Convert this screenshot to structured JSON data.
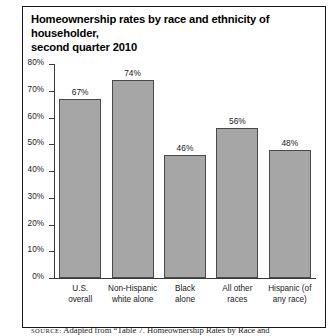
{
  "figure": {
    "title": "Homeownership rates by race and ethnicity of householder, second quarter 2010",
    "title_line1": "Homeownership rates by race and ethnicity of householder,",
    "title_line2": "second quarter 2010",
    "source_kicker": "SOURCE:",
    "source_text": "Adapted from “Table 7. Homeownership Rates by Race and"
  },
  "chart_data": {
    "type": "bar",
    "title": "Homeownership rates by race and ethnicity of householder, second quarter 2010",
    "xlabel": "",
    "ylabel": "",
    "categories": [
      "U.S. overall",
      "Non-Hispanic white alone",
      "Black alone",
      "All other races",
      "Hispanic (of any race)"
    ],
    "category_lines": [
      [
        "U.S.",
        "overall"
      ],
      [
        "Non-Hispanic",
        "white alone"
      ],
      [
        "Black",
        "alone"
      ],
      [
        "All other",
        "races"
      ],
      [
        "Hispanic (of",
        "any race)"
      ]
    ],
    "values": [
      67,
      74,
      46,
      56,
      48
    ],
    "value_labels": [
      "67%",
      "74%",
      "46%",
      "56%",
      "48%"
    ],
    "ylim": [
      0,
      80
    ],
    "yticks": [
      0,
      10,
      20,
      30,
      40,
      50,
      60,
      70,
      80
    ],
    "ytick_labels": [
      "0%",
      "10%",
      "20%",
      "30%",
      "40%",
      "50%",
      "60%",
      "70%",
      "80%"
    ],
    "grid": false,
    "legend": false,
    "bar_color": "#a6a6a6",
    "bar_edge_color": "#4a4a4a",
    "axis_color": "#3a3a3a",
    "text_color": "#1a1a1a",
    "background": "#ffffff"
  }
}
